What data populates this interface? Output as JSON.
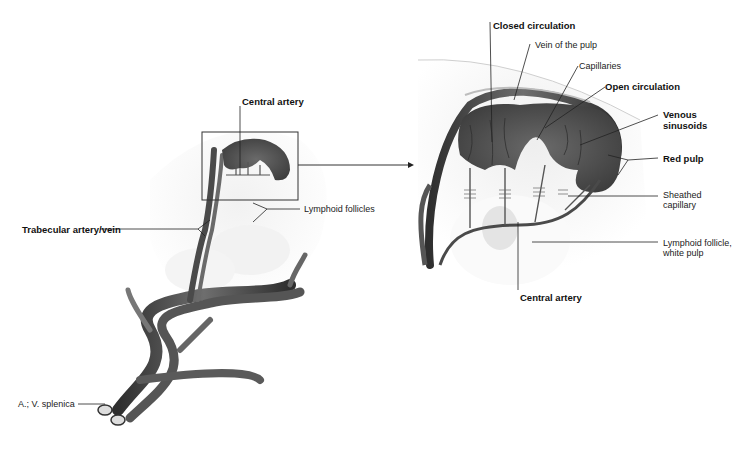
{
  "figure": {
    "overview": {
      "labels": {
        "central_artery": "Central artery",
        "lymphoid_follicles": "Lymphoid follicles",
        "trabecular": "Trabecular artery/vein",
        "splenic": "A.; V. splenica"
      }
    },
    "detail": {
      "labels": {
        "closed_circulation": "Closed circulation",
        "vein_of_pulp": "Vein of the pulp",
        "capillaries": "Capillaries",
        "open_circulation": "Open circulation",
        "venous_sinusoids_1": "Venous",
        "venous_sinusoids_2": "sinusoids",
        "red_pulp": "Red pulp",
        "sheathed_capillary_1": "Sheathed",
        "sheathed_capillary_2": "capillary",
        "lymphoid_follicle_1": "Lymphoid follicle,",
        "lymphoid_follicle_2": "white pulp",
        "central_artery": "Central artery"
      }
    },
    "colors": {
      "vessel": "#4a4a4a",
      "pulp": "#5c5c5c",
      "tissue": "#e8e8e8",
      "follicle": "#f7f7f7",
      "leader": "#333333"
    }
  }
}
